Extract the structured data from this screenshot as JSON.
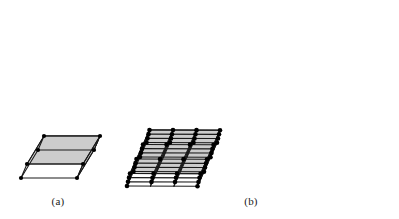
{
  "figure": {
    "kind": "crystal-lattice-diagram",
    "background_color": "#ffffff",
    "panels": [
      {
        "id": "a",
        "caption": "(a)",
        "description": "single parallelepiped unit cell",
        "cells_x": 1,
        "cells_y": 1,
        "cells_z": 1
      },
      {
        "id": "b",
        "caption": "(b)",
        "description": "three by three by three array of unit cells forming a space lattice",
        "cells_x": 3,
        "cells_y": 3,
        "cells_z": 3
      }
    ]
  },
  "captions": {
    "panel_a": "(a)",
    "panel_b": "(b)"
  },
  "colors": {
    "top_face": "#d9d9d9",
    "side_face": "#b4b4b4",
    "front_face": "#cccccc",
    "edge": "#1a1a1a",
    "vertex": "#000000",
    "background": "#ffffff",
    "caption_text": "#1a1a1a"
  },
  "geometry": {
    "panel_a": {
      "origin_x": 21,
      "origin_y": 178,
      "vec_a": {
        "dx": 56,
        "dy": 0
      },
      "vec_b": {
        "dx": 17,
        "dy": -28
      },
      "vec_c": {
        "dx": 6,
        "dy": -14
      },
      "edge_width": 1.1,
      "vertex_radius": 2.1
    },
    "panel_b": {
      "origin_x": 127,
      "origin_y": 186,
      "vec_a": {
        "dx": 70.5,
        "dy": 0.2
      },
      "vec_b": {
        "dx": 19.5,
        "dy": -43.5
      },
      "vec_c": {
        "dx": 3.0,
        "dy": -12.5
      },
      "divisions": 3,
      "edge_width": 1.1,
      "vertex_radius": 2.3
    }
  }
}
